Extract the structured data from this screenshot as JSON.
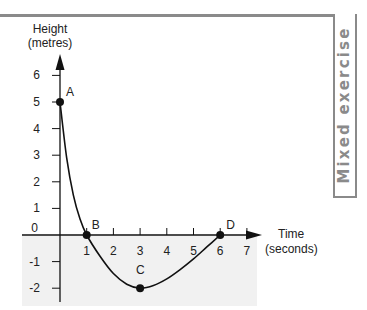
{
  "side_tab": {
    "label": "Mixed exercise"
  },
  "chart_data": {
    "type": "line",
    "title": "",
    "xlabel": "Time (seconds)",
    "ylabel": "Height (metres)",
    "xlabel_lines": [
      "Time",
      "(seconds)"
    ],
    "ylabel_lines": [
      "Height",
      "(metres)"
    ],
    "x_ticks": [
      1,
      2,
      3,
      4,
      5,
      6,
      7
    ],
    "y_ticks": [
      6,
      5,
      4,
      3,
      2,
      1,
      0,
      -1,
      -2
    ],
    "xlim": [
      0,
      7.5
    ],
    "ylim": [
      -2.4,
      6.8
    ],
    "grid": false,
    "shaded_region": "below x-axis (light grey)",
    "points": [
      {
        "label": "A",
        "x": 0,
        "y": 5
      },
      {
        "label": "B",
        "x": 1,
        "y": 0
      },
      {
        "label": "C",
        "x": 3,
        "y": -2
      },
      {
        "label": "D",
        "x": 6,
        "y": 0
      }
    ],
    "series": [
      {
        "name": "height curve",
        "x": [
          0,
          0.25,
          0.5,
          0.75,
          1,
          1.5,
          2,
          2.5,
          3,
          3.5,
          4,
          4.5,
          5,
          5.5,
          6
        ],
        "y": [
          5,
          2.9,
          1.5,
          0.6,
          0,
          -0.8,
          -1.45,
          -1.85,
          -2,
          -1.9,
          -1.65,
          -1.3,
          -0.9,
          -0.45,
          0
        ]
      }
    ]
  }
}
